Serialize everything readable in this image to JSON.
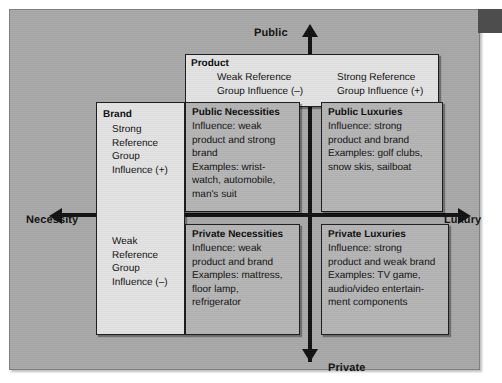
{
  "figure": {
    "type": "2x2-matrix-diagram",
    "axes": {
      "vertical_top_label": "Public",
      "vertical_bottom_label": "Private",
      "horizontal_left_label": "Necessity",
      "horizontal_right_label": "Luxury"
    }
  },
  "product_header": {
    "title": "Product",
    "left_column": [
      "Weak Reference",
      "Group Influence (–)"
    ],
    "right_column": [
      "Strong Reference",
      "Group Influence (+)"
    ]
  },
  "brand_header": {
    "title": "Brand",
    "upper": [
      "Strong",
      "Reference",
      "Group",
      "Influence (+)"
    ],
    "lower": [
      "Weak",
      "Reference",
      "Group",
      "Influence (–)"
    ]
  },
  "quadrants": {
    "public_necessities": {
      "title": "Public Necessities",
      "lines": [
        "Influence: weak",
        "product and strong",
        "brand",
        "Examples: wrist-",
        "watch, automobile,",
        "man's suit"
      ]
    },
    "public_luxuries": {
      "title": "Public Luxuries",
      "lines": [
        "Influence: strong",
        "product and brand",
        "Examples: golf clubs,",
        "snow skis, sailboat"
      ]
    },
    "private_necessities": {
      "title": "Private Necessities",
      "lines": [
        "Influence: weak",
        "product and brand",
        "Examples: mattress,",
        "floor lamp,",
        "refrigerator"
      ]
    },
    "private_luxuries": {
      "title": "Private Luxuries",
      "lines": [
        "Influence: strong",
        "product and weak brand",
        "Examples: TV game,",
        "audio/video entertain-",
        "ment components"
      ]
    }
  },
  "colors": {
    "page_background": "#a8a8a8",
    "light_box": "#e2e2e2",
    "mid_box": "#b4b4b4",
    "axis": "#111111",
    "corner_tab": "#4d4d4d"
  }
}
